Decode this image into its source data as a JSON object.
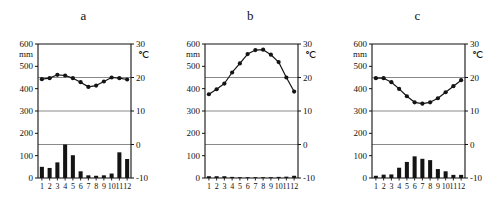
{
  "figure": {
    "background": "#ffffff",
    "ink": "#111111",
    "gridline_color": "#8a8a8a",
    "bar_color": "#141414",
    "line_color": "#141414"
  },
  "axes": {
    "left_unit": "mm",
    "right_unit": "℃",
    "left_ticks": [
      "600",
      "500",
      "400",
      "300",
      "200",
      "100",
      "0"
    ],
    "left_tick_values": [
      600,
      500,
      400,
      300,
      200,
      100,
      0
    ],
    "right_ticks": [
      "30",
      "20",
      "10",
      "0",
      "-10"
    ],
    "right_tick_values": [
      30,
      20,
      10,
      0,
      -10
    ],
    "month_labels": [
      "1",
      "2",
      "3",
      "4",
      "5",
      "6",
      "7",
      "8",
      "9",
      "10",
      "11",
      "12"
    ],
    "precip_range": [
      0,
      600
    ],
    "temp_range": [
      -10,
      30
    ],
    "gridlines_precip": [
      450,
      300,
      150
    ]
  },
  "panels": [
    {
      "id": "a",
      "title": "a",
      "x_offset": 0
    },
    {
      "id": "b",
      "title": "b",
      "x_offset": 167
    },
    {
      "id": "c",
      "title": "c",
      "x_offset": 334
    }
  ],
  "chart_data": [
    {
      "type": "bar",
      "id": "a",
      "title": "a",
      "xlabel": "",
      "ylabel": "mm",
      "y2label": "℃",
      "categories": [
        "1",
        "2",
        "3",
        "4",
        "5",
        "6",
        "7",
        "8",
        "9",
        "10",
        "11",
        "12"
      ],
      "ylim": [
        0,
        600
      ],
      "y2lim": [
        -10,
        30
      ],
      "grid": true,
      "legend": "none",
      "series": [
        {
          "name": "Precipitation (mm)",
          "type": "bar",
          "values": [
            50,
            45,
            70,
            150,
            102,
            30,
            12,
            10,
            12,
            20,
            115,
            85
          ]
        },
        {
          "name": "Temperature (℃)",
          "type": "line",
          "values": [
            19.5,
            19.8,
            20.8,
            20.6,
            19.8,
            18.6,
            17.2,
            17.6,
            18.8,
            20.0,
            19.8,
            19.4
          ]
        }
      ]
    },
    {
      "type": "bar",
      "id": "b",
      "title": "b",
      "xlabel": "",
      "ylabel": "mm",
      "y2label": "℃",
      "categories": [
        "1",
        "2",
        "3",
        "4",
        "5",
        "6",
        "7",
        "8",
        "9",
        "10",
        "11",
        "12"
      ],
      "ylim": [
        0,
        600
      ],
      "y2lim": [
        -10,
        30
      ],
      "grid": true,
      "legend": "none",
      "series": [
        {
          "name": "Precipitation (mm)",
          "type": "bar",
          "values": [
            8,
            8,
            8,
            5,
            3,
            1,
            0,
            0,
            1,
            5,
            6,
            10
          ]
        },
        {
          "name": "Temperature (℃)",
          "type": "line",
          "values": [
            15.0,
            16.5,
            18.2,
            21.5,
            24.2,
            27.0,
            28.2,
            28.3,
            26.8,
            24.6,
            20.0,
            15.8
          ]
        }
      ]
    },
    {
      "type": "bar",
      "id": "c",
      "title": "c",
      "xlabel": "",
      "ylabel": "mm",
      "y2label": "℃",
      "categories": [
        "1",
        "2",
        "3",
        "4",
        "5",
        "6",
        "7",
        "8",
        "9",
        "10",
        "11",
        "12"
      ],
      "ylim": [
        0,
        600
      ],
      "y2lim": [
        -10,
        30
      ],
      "grid": true,
      "legend": "none",
      "series": [
        {
          "name": "Precipitation (mm)",
          "type": "bar",
          "values": [
            10,
            15,
            16,
            46,
            72,
            97,
            86,
            80,
            40,
            30,
            14,
            14
          ]
        },
        {
          "name": "Temperature (℃)",
          "type": "line",
          "values": [
            19.8,
            19.8,
            18.6,
            16.6,
            14.4,
            12.6,
            12.2,
            12.6,
            13.8,
            15.6,
            17.4,
            19.2
          ]
        }
      ]
    }
  ]
}
